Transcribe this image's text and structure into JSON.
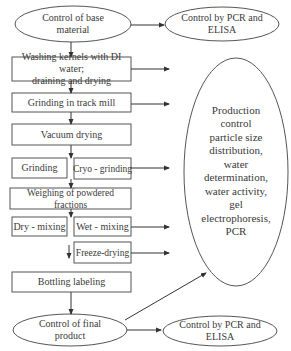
{
  "diagram": {
    "type": "flowchart",
    "start": {
      "id": "base",
      "label": "Control of base\nmaterial",
      "shape": "ellipse"
    },
    "steps": [
      {
        "id": "washing",
        "label": "Washing kernels with DI water;\ndraining and drying"
      },
      {
        "id": "grinding_mill",
        "label": "Grinding in track mill"
      },
      {
        "id": "vacuum",
        "label": "Vacuum drying"
      },
      {
        "id": "grinding",
        "label": "Grinding"
      },
      {
        "id": "cryo",
        "label": "Cryo - grinding"
      },
      {
        "id": "weighing",
        "label": "Weighing of powdered fractions"
      },
      {
        "id": "dry_mixing",
        "label": "Dry - mixing"
      },
      {
        "id": "wet_mixing",
        "label": "Wet - mixing"
      },
      {
        "id": "freeze",
        "label": "Freeze-drying"
      },
      {
        "id": "bottling",
        "label": "Bottling labeling"
      }
    ],
    "end": {
      "id": "final",
      "label": "Control of final\nproduct",
      "shape": "ellipse"
    },
    "controls": {
      "top": {
        "label": "Control by PCR and\nELISA"
      },
      "production": {
        "label": "Production\ncontrol\nparticle size\ndistribution,\nwater\ndetermination,\nwater activity,\ngel\nelectrophoresis,\nPCR"
      },
      "bottom": {
        "label": "Control by PCR and\nELISA"
      }
    },
    "edges": [
      [
        "base",
        "washing"
      ],
      [
        "washing",
        "grinding_mill"
      ],
      [
        "grinding_mill",
        "vacuum"
      ],
      [
        "vacuum",
        "grinding/cryo"
      ],
      [
        "grinding/cryo",
        "weighing"
      ],
      [
        "weighing",
        "dry/wet mixing"
      ],
      [
        "wet_mixing",
        "freeze"
      ],
      [
        "bottling",
        "final"
      ],
      [
        "base",
        "top"
      ],
      [
        "washing",
        "production"
      ],
      [
        "grinding_mill",
        "production"
      ],
      [
        "cryo",
        "production"
      ],
      [
        "wet_mixing",
        "production"
      ],
      [
        "freeze",
        "production"
      ],
      [
        "final",
        "production"
      ],
      [
        "final",
        "bottom"
      ]
    ],
    "line_color": "#444444"
  }
}
